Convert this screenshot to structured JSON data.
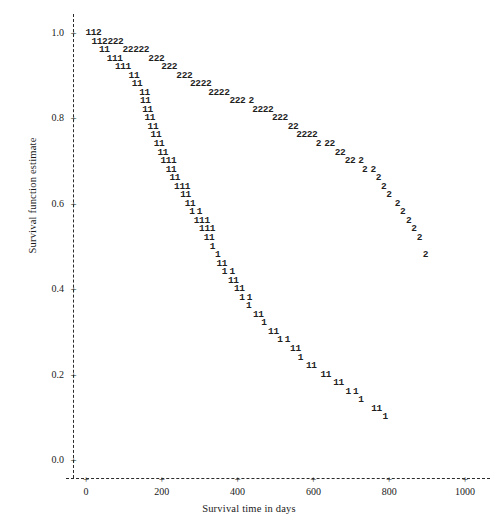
{
  "chart_data": {
    "type": "scatter",
    "title": "",
    "subtitle": "",
    "xlabel": "Survival time in days",
    "ylabel": "Survival function estimate",
    "xlim": [
      -30,
      1040
    ],
    "ylim": [
      0.0,
      1.03
    ],
    "grid": false,
    "legend_position": "none",
    "plot_style": "character-plot",
    "x_ticks": [
      0,
      200,
      400,
      600,
      800,
      1000
    ],
    "x_tick_labels": [
      "0",
      "200",
      "400",
      "600",
      "800",
      "1000"
    ],
    "y_ticks": [
      0.0,
      0.2,
      0.4,
      0.6,
      0.8,
      1.0
    ],
    "y_tick_labels": [
      "0.0",
      "0.2",
      "0.4",
      "0.6",
      "0.8",
      "1.0"
    ],
    "tick_marker": "+",
    "axis_line_style": "dashed",
    "series": [
      {
        "name": "1",
        "marker": "1",
        "points": [
          {
            "x": 6,
            "y": 1.0
          },
          {
            "x": 20,
            "y": 1.0
          },
          {
            "x": 22,
            "y": 0.98
          },
          {
            "x": 36,
            "y": 0.98
          },
          {
            "x": 42,
            "y": 0.96
          },
          {
            "x": 56,
            "y": 0.96
          },
          {
            "x": 62,
            "y": 0.94
          },
          {
            "x": 76,
            "y": 0.94
          },
          {
            "x": 90,
            "y": 0.94
          },
          {
            "x": 84,
            "y": 0.92
          },
          {
            "x": 98,
            "y": 0.92
          },
          {
            "x": 112,
            "y": 0.92
          },
          {
            "x": 120,
            "y": 0.9
          },
          {
            "x": 134,
            "y": 0.9
          },
          {
            "x": 128,
            "y": 0.88
          },
          {
            "x": 142,
            "y": 0.88
          },
          {
            "x": 148,
            "y": 0.86
          },
          {
            "x": 162,
            "y": 0.86
          },
          {
            "x": 150,
            "y": 0.84
          },
          {
            "x": 164,
            "y": 0.84
          },
          {
            "x": 156,
            "y": 0.82
          },
          {
            "x": 170,
            "y": 0.82
          },
          {
            "x": 162,
            "y": 0.8
          },
          {
            "x": 176,
            "y": 0.8
          },
          {
            "x": 170,
            "y": 0.78
          },
          {
            "x": 184,
            "y": 0.78
          },
          {
            "x": 178,
            "y": 0.76
          },
          {
            "x": 192,
            "y": 0.76
          },
          {
            "x": 186,
            "y": 0.74
          },
          {
            "x": 200,
            "y": 0.74
          },
          {
            "x": 196,
            "y": 0.72
          },
          {
            "x": 210,
            "y": 0.72
          },
          {
            "x": 204,
            "y": 0.7
          },
          {
            "x": 218,
            "y": 0.7
          },
          {
            "x": 232,
            "y": 0.7
          },
          {
            "x": 218,
            "y": 0.68
          },
          {
            "x": 232,
            "y": 0.68
          },
          {
            "x": 228,
            "y": 0.66
          },
          {
            "x": 242,
            "y": 0.66
          },
          {
            "x": 240,
            "y": 0.64
          },
          {
            "x": 254,
            "y": 0.64
          },
          {
            "x": 268,
            "y": 0.64
          },
          {
            "x": 256,
            "y": 0.62
          },
          {
            "x": 270,
            "y": 0.62
          },
          {
            "x": 268,
            "y": 0.6
          },
          {
            "x": 282,
            "y": 0.6
          },
          {
            "x": 280,
            "y": 0.58
          },
          {
            "x": 300,
            "y": 0.58
          },
          {
            "x": 292,
            "y": 0.56
          },
          {
            "x": 306,
            "y": 0.56
          },
          {
            "x": 320,
            "y": 0.56
          },
          {
            "x": 306,
            "y": 0.54
          },
          {
            "x": 320,
            "y": 0.54
          },
          {
            "x": 334,
            "y": 0.54
          },
          {
            "x": 318,
            "y": 0.52
          },
          {
            "x": 332,
            "y": 0.52
          },
          {
            "x": 334,
            "y": 0.5
          },
          {
            "x": 348,
            "y": 0.48
          },
          {
            "x": 352,
            "y": 0.46
          },
          {
            "x": 366,
            "y": 0.46
          },
          {
            "x": 366,
            "y": 0.44
          },
          {
            "x": 386,
            "y": 0.44
          },
          {
            "x": 382,
            "y": 0.42
          },
          {
            "x": 396,
            "y": 0.42
          },
          {
            "x": 398,
            "y": 0.4
          },
          {
            "x": 412,
            "y": 0.4
          },
          {
            "x": 412,
            "y": 0.38
          },
          {
            "x": 432,
            "y": 0.38
          },
          {
            "x": 430,
            "y": 0.36
          },
          {
            "x": 448,
            "y": 0.34
          },
          {
            "x": 462,
            "y": 0.34
          },
          {
            "x": 470,
            "y": 0.32
          },
          {
            "x": 488,
            "y": 0.3
          },
          {
            "x": 502,
            "y": 0.3
          },
          {
            "x": 512,
            "y": 0.28
          },
          {
            "x": 532,
            "y": 0.28
          },
          {
            "x": 546,
            "y": 0.26
          },
          {
            "x": 560,
            "y": 0.26
          },
          {
            "x": 566,
            "y": 0.24
          },
          {
            "x": 588,
            "y": 0.22
          },
          {
            "x": 602,
            "y": 0.22
          },
          {
            "x": 626,
            "y": 0.2
          },
          {
            "x": 640,
            "y": 0.2
          },
          {
            "x": 660,
            "y": 0.18
          },
          {
            "x": 674,
            "y": 0.18
          },
          {
            "x": 692,
            "y": 0.16
          },
          {
            "x": 712,
            "y": 0.16
          },
          {
            "x": 726,
            "y": 0.14
          },
          {
            "x": 760,
            "y": 0.12
          },
          {
            "x": 774,
            "y": 0.12
          },
          {
            "x": 790,
            "y": 0.1
          }
        ]
      },
      {
        "name": "2",
        "marker": "2",
        "points": [
          {
            "x": 34,
            "y": 1.0
          },
          {
            "x": 50,
            "y": 0.98
          },
          {
            "x": 64,
            "y": 0.98
          },
          {
            "x": 78,
            "y": 0.98
          },
          {
            "x": 92,
            "y": 0.98
          },
          {
            "x": 104,
            "y": 0.96
          },
          {
            "x": 118,
            "y": 0.96
          },
          {
            "x": 132,
            "y": 0.96
          },
          {
            "x": 146,
            "y": 0.96
          },
          {
            "x": 160,
            "y": 0.96
          },
          {
            "x": 172,
            "y": 0.94
          },
          {
            "x": 186,
            "y": 0.94
          },
          {
            "x": 200,
            "y": 0.94
          },
          {
            "x": 206,
            "y": 0.92
          },
          {
            "x": 220,
            "y": 0.92
          },
          {
            "x": 234,
            "y": 0.92
          },
          {
            "x": 246,
            "y": 0.9
          },
          {
            "x": 260,
            "y": 0.9
          },
          {
            "x": 274,
            "y": 0.9
          },
          {
            "x": 282,
            "y": 0.88
          },
          {
            "x": 296,
            "y": 0.88
          },
          {
            "x": 310,
            "y": 0.88
          },
          {
            "x": 324,
            "y": 0.88
          },
          {
            "x": 330,
            "y": 0.86
          },
          {
            "x": 344,
            "y": 0.86
          },
          {
            "x": 358,
            "y": 0.86
          },
          {
            "x": 372,
            "y": 0.86
          },
          {
            "x": 386,
            "y": 0.84
          },
          {
            "x": 400,
            "y": 0.84
          },
          {
            "x": 414,
            "y": 0.84
          },
          {
            "x": 436,
            "y": 0.84
          },
          {
            "x": 446,
            "y": 0.82
          },
          {
            "x": 460,
            "y": 0.82
          },
          {
            "x": 474,
            "y": 0.82
          },
          {
            "x": 488,
            "y": 0.82
          },
          {
            "x": 498,
            "y": 0.8
          },
          {
            "x": 512,
            "y": 0.8
          },
          {
            "x": 526,
            "y": 0.8
          },
          {
            "x": 540,
            "y": 0.78
          },
          {
            "x": 554,
            "y": 0.78
          },
          {
            "x": 562,
            "y": 0.76
          },
          {
            "x": 576,
            "y": 0.76
          },
          {
            "x": 590,
            "y": 0.76
          },
          {
            "x": 604,
            "y": 0.76
          },
          {
            "x": 614,
            "y": 0.74
          },
          {
            "x": 636,
            "y": 0.74
          },
          {
            "x": 650,
            "y": 0.74
          },
          {
            "x": 664,
            "y": 0.72
          },
          {
            "x": 678,
            "y": 0.72
          },
          {
            "x": 690,
            "y": 0.7
          },
          {
            "x": 704,
            "y": 0.7
          },
          {
            "x": 726,
            "y": 0.7
          },
          {
            "x": 736,
            "y": 0.68
          },
          {
            "x": 758,
            "y": 0.68
          },
          {
            "x": 772,
            "y": 0.66
          },
          {
            "x": 786,
            "y": 0.64
          },
          {
            "x": 800,
            "y": 0.62
          },
          {
            "x": 822,
            "y": 0.6
          },
          {
            "x": 836,
            "y": 0.58
          },
          {
            "x": 852,
            "y": 0.56
          },
          {
            "x": 866,
            "y": 0.54
          },
          {
            "x": 880,
            "y": 0.52
          },
          {
            "x": 896,
            "y": 0.48
          }
        ]
      }
    ]
  }
}
